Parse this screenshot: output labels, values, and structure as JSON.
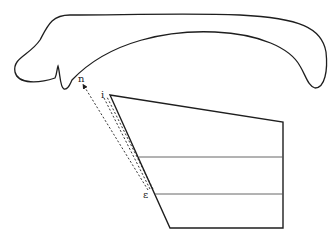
{
  "diagram": {
    "colors": {
      "stroke": "#1e1e1e",
      "background": "#ffffff"
    },
    "labels": [
      {
        "id": "n",
        "text": "n",
        "x": 78,
        "y": 74
      },
      {
        "id": "i",
        "text": "i",
        "x": 101,
        "y": 90
      },
      {
        "id": "epsilon",
        "text": "ε",
        "x": 143,
        "y": 190
      }
    ],
    "shapes": {
      "outline": "curved elongated outline (upper body)",
      "quadrilateral": {
        "points": [
          [
            110,
            95
          ],
          [
            283,
            122
          ],
          [
            283,
            228
          ],
          [
            170,
            228
          ]
        ]
      },
      "horizontal_lines_y": [
        157,
        194
      ],
      "dashed_lines": [
        {
          "from": "epsilon",
          "to": "n",
          "arrow_at": "n"
        },
        {
          "from": "epsilon",
          "to": "i"
        },
        {
          "from": "epsilon",
          "to": "i",
          "offset": "parallel"
        }
      ]
    }
  }
}
